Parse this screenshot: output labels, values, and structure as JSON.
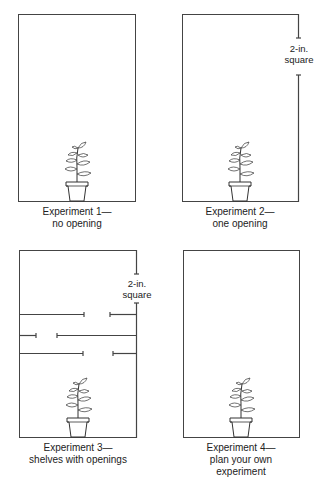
{
  "experiments": [
    {
      "id": 1,
      "caption_line1": "Experiment 1—",
      "caption_line2": "no opening",
      "caption_line3": "",
      "opening": false,
      "shelves": false
    },
    {
      "id": 2,
      "caption_line1": "Experiment 2—",
      "caption_line2": "one opening",
      "caption_line3": "",
      "opening": true,
      "opening_label_line1": "2-in.",
      "opening_label_line2": "square",
      "shelves": false
    },
    {
      "id": 3,
      "caption_line1": "Experiment 3—",
      "caption_line2": "shelves with openings",
      "caption_line3": "",
      "opening": true,
      "opening_label_line1": "2-in.",
      "opening_label_line2": "square",
      "shelves": true,
      "shelf_count": 3
    },
    {
      "id": 4,
      "caption_line1": "Experiment 4—",
      "caption_line2": "plan your own",
      "caption_line3": "experiment",
      "opening": false,
      "shelves": false
    }
  ],
  "colors": {
    "line": "#444444",
    "background": "#ffffff",
    "text": "#222222"
  }
}
